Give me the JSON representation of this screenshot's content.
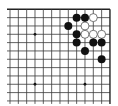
{
  "diagram": {
    "type": "go-board-partial",
    "view": "top-right corner region",
    "colors": {
      "background": "#ffffff",
      "line": "#3a3a3a",
      "black": "#111111",
      "white": "#ffffff"
    },
    "grid": {
      "cols": 13,
      "rows": 12,
      "origin_x": 10,
      "origin_y": 9.3,
      "spacing": 8.33,
      "left_overhang": 3,
      "bottom_overhang": 3,
      "edges": [
        "top",
        "right"
      ]
    },
    "star_points": [
      {
        "col": 3,
        "row": 3
      },
      {
        "col": 3,
        "row": 9
      },
      {
        "col": 9,
        "row": 9
      }
    ],
    "stones": [
      {
        "color": "black",
        "col": 8,
        "row": 1
      },
      {
        "color": "black",
        "col": 9,
        "row": 1
      },
      {
        "color": "white",
        "col": 10,
        "row": 1
      },
      {
        "color": "black",
        "col": 7,
        "row": 2
      },
      {
        "color": "white",
        "col": 9,
        "row": 2
      },
      {
        "color": "black",
        "col": 8,
        "row": 3
      },
      {
        "color": "white",
        "col": 9,
        "row": 3
      },
      {
        "color": "white",
        "col": 10,
        "row": 3
      },
      {
        "color": "white",
        "col": 11,
        "row": 3
      },
      {
        "color": "black",
        "col": 8,
        "row": 4
      },
      {
        "color": "black",
        "col": 10,
        "row": 4
      },
      {
        "color": "black",
        "col": 11,
        "row": 4
      },
      {
        "color": "black",
        "col": 9,
        "row": 5
      },
      {
        "color": "black",
        "col": 11,
        "row": 6
      }
    ]
  }
}
